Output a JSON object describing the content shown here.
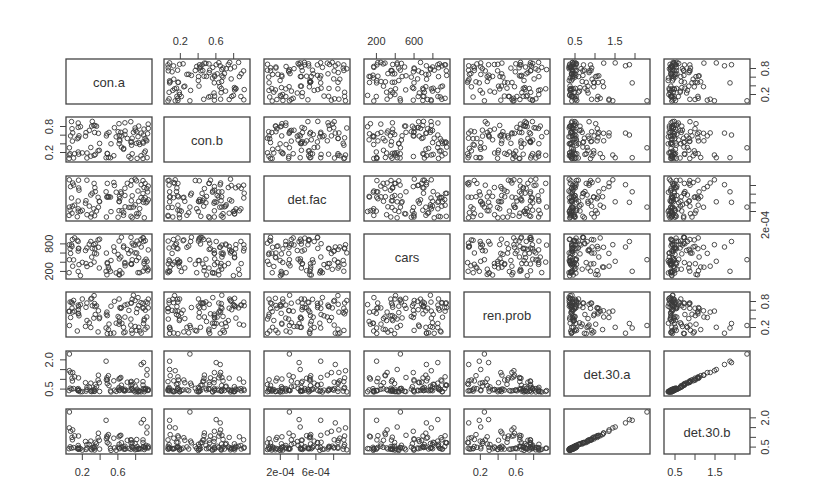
{
  "chart_data": {
    "type": "scatter",
    "subtype": "scatterplot-matrix",
    "title": "",
    "n_points": 100,
    "variables": [
      {
        "name": "con.a",
        "range": [
          0.05,
          0.95
        ],
        "ticks": [
          0.2,
          0.4,
          0.6,
          0.8
        ],
        "tick_labels": [
          "0.2",
          "",
          "0.6",
          ""
        ],
        "distribution": "uniform"
      },
      {
        "name": "con.b",
        "range": [
          0.05,
          0.95
        ],
        "ticks": [
          0.2,
          0.4,
          0.6,
          0.8
        ],
        "tick_labels": [
          "0.2",
          "",
          "0.6",
          ""
        ],
        "distribution": "uniform"
      },
      {
        "name": "det.fac",
        "range": [
          5e-05,
          0.00095
        ],
        "ticks": [
          0.0002,
          0.0004,
          0.0006,
          0.0008
        ],
        "tick_labels": [
          "2e-04",
          "",
          "6e-04",
          ""
        ],
        "distribution": "uniform"
      },
      {
        "name": "cars",
        "range": [
          100,
          950
        ],
        "ticks": [
          200,
          400,
          600,
          800
        ],
        "tick_labels": [
          "200",
          "",
          "600",
          ""
        ],
        "distribution": "uniform"
      },
      {
        "name": "ren.prob",
        "range": [
          0.05,
          0.95
        ],
        "ticks": [
          0.2,
          0.4,
          0.6,
          0.8
        ],
        "tick_labels": [
          "0.2",
          "",
          "0.6",
          ""
        ],
        "distribution": "uniform"
      },
      {
        "name": "det.30.a",
        "range": [
          0.3,
          2.3
        ],
        "ticks": [
          0.5,
          1.0,
          1.5,
          2.0
        ],
        "tick_labels": [
          "0.5",
          "",
          "1.5",
          ""
        ],
        "distribution": "skewed"
      },
      {
        "name": "det.30.b",
        "range": [
          0.3,
          2.3
        ],
        "ticks": [
          0.5,
          1.0,
          1.5,
          2.0
        ],
        "tick_labels": [
          "0.5",
          "",
          "1.5",
          "2.0"
        ],
        "distribution": "skewed"
      }
    ],
    "axis_placement": {
      "top": [
        1,
        3,
        5
      ],
      "bottom": [
        0,
        2,
        4,
        6
      ],
      "left": [
        1,
        3,
        5
      ],
      "right": [
        0,
        2,
        4,
        6
      ]
    },
    "left_tick_labels": {
      "1": [
        "0.2",
        "",
        "",
        "0.8"
      ],
      "3": [
        "200",
        "",
        "",
        "800"
      ],
      "5": [
        "0.5",
        "",
        "",
        "2.0"
      ]
    },
    "right_tick_labels": {
      "0": [
        "0.2",
        "",
        "",
        "0.8"
      ],
      "2": [
        "2e-04",
        "",
        "",
        ""
      ],
      "4": [
        "0.2",
        "",
        "",
        "0.8"
      ],
      "6": [
        "0.5",
        "",
        "",
        "2.0"
      ]
    },
    "relationships": {
      "det.30.a~ren.prob": "negative, decaying",
      "det.30.b~ren.prob": "negative, decaying",
      "det.30.a~det.30.b": "strong positive linear",
      "det.30~det.fac": "weak positive",
      "det.30~cars": "weak positive",
      "others": "no correlation"
    },
    "marker": "open circle",
    "grid": false,
    "legend": "none"
  }
}
